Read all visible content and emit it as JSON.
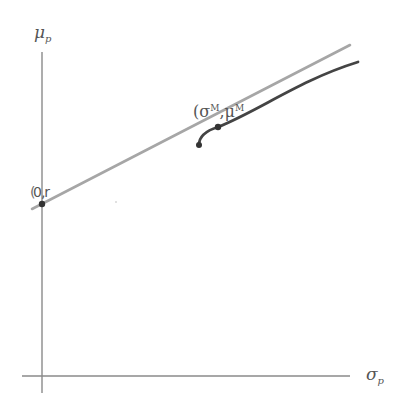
{
  "diagram": {
    "type": "capital-market-line",
    "axes": {
      "y_label": "μ",
      "y_label_sub": "p",
      "x_label": "σ",
      "x_label_sub": "p"
    },
    "labels": {
      "intercept": "0,r",
      "intercept_prefix": "(",
      "tangent_point_open": "(σ",
      "tangent_point_sup1": "M",
      "tangent_point_mid": ",μ",
      "tangent_point_sup2": "M",
      "tangent_point_close": ")"
    },
    "colors": {
      "axis": "#888888",
      "tangent_line": "#a6a6a6",
      "frontier_curve": "#444444",
      "point": "#333333",
      "text": "#555555"
    },
    "elements": [
      {
        "name": "y-axis",
        "description": "vertical axis"
      },
      {
        "name": "x-axis",
        "description": "horizontal axis"
      },
      {
        "name": "tangent-line",
        "description": "straight line from risk-free rate tangent to frontier"
      },
      {
        "name": "efficient-frontier",
        "description": "curved risky-asset frontier"
      },
      {
        "name": "risk-free-point",
        "description": "point (0, r) on y-axis"
      },
      {
        "name": "market-portfolio-point",
        "description": "tangency point (σM, μM)"
      }
    ]
  }
}
